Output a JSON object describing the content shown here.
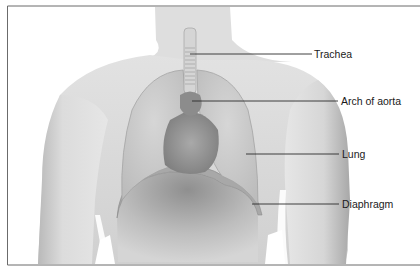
{
  "figure": {
    "labels": [
      {
        "id": "trachea",
        "text": "Trachea",
        "line": {
          "x1": 190,
          "y1": 54,
          "x2": 312,
          "y2": 54
        },
        "text_x": 314,
        "text_y": 49
      },
      {
        "id": "arch-of-aorta",
        "text": "Arch of aorta",
        "line": {
          "x1": 192,
          "y1": 101,
          "x2": 338,
          "y2": 101
        },
        "text_x": 341,
        "text_y": 96
      },
      {
        "id": "lung",
        "text": "Lung",
        "line": {
          "x1": 246,
          "y1": 154,
          "x2": 339,
          "y2": 154
        },
        "text_x": 342,
        "text_y": 149
      },
      {
        "id": "diaphragm",
        "text": "Diaphragm",
        "line": {
          "x1": 252,
          "y1": 204,
          "x2": 339,
          "y2": 204
        },
        "text_x": 342,
        "text_y": 199
      }
    ],
    "colors": {
      "frame": "#6b6b6b",
      "skin_light": "#e4e4e4",
      "skin_mid": "#c9c9c9",
      "skin_dark": "#9c9c9c",
      "leader_line": "#2a2a2a"
    }
  }
}
